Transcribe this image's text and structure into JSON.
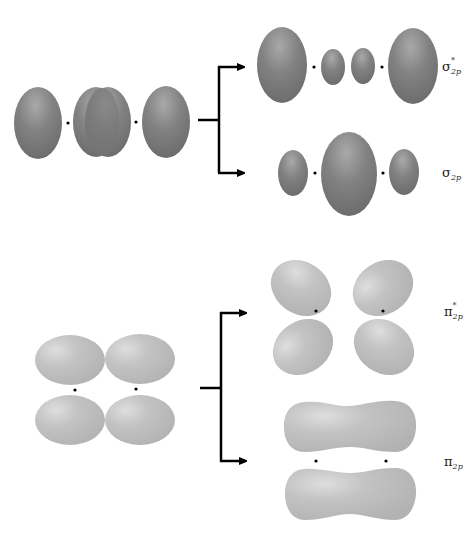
{
  "diagram": {
    "colors": {
      "sigma_lobe": "#7a7a7a",
      "sigma_highlight": "#a8a8a8",
      "pi_lobe": "#bdbdbd",
      "pi_highlight": "#dcdcdc",
      "arrow": "#000000",
      "nucleus": "#000000"
    },
    "sections": [
      {
        "id": "sigma",
        "source": "2p_z atomic orbitals (head-on overlap)",
        "branches": [
          {
            "id": "sigma_star_2p",
            "symbol": "σ",
            "subscript": "2p",
            "antibonding": true,
            "star": "*",
            "position": "upper"
          },
          {
            "id": "sigma_2p",
            "symbol": "σ",
            "subscript": "2p",
            "antibonding": false,
            "star": "",
            "position": "lower"
          }
        ]
      },
      {
        "id": "pi",
        "source": "2p_x / 2p_y atomic orbitals (side-by-side overlap)",
        "branches": [
          {
            "id": "pi_star_2p",
            "symbol": "π",
            "subscript": "2p",
            "antibonding": true,
            "star": "*",
            "position": "upper"
          },
          {
            "id": "pi_2p",
            "symbol": "π",
            "subscript": "2p",
            "antibonding": false,
            "star": "",
            "position": "lower"
          }
        ]
      }
    ]
  },
  "labels": {
    "sigma_star": {
      "symbol": "σ",
      "star": "*",
      "sub": "2p"
    },
    "sigma": {
      "symbol": "σ",
      "sub": "2p"
    },
    "pi_star": {
      "symbol": "π",
      "star": "*",
      "sub": "2p"
    },
    "pi": {
      "symbol": "π",
      "sub": "2p"
    }
  }
}
